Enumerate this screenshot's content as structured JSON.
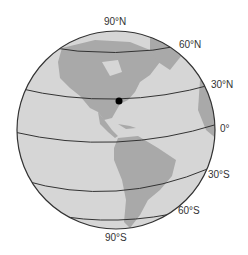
{
  "diagram": {
    "type": "globe-latitude-lines",
    "colors": {
      "ocean": "#d4d4d4",
      "land": "#a8a8a8",
      "lines": "#333333",
      "marker": "#000000"
    },
    "labels": {
      "n90": "90°N",
      "n60": "60°N",
      "n30": "30°N",
      "eq": "0°",
      "s30": "30°S",
      "s60": "60°S",
      "s90": "90°S"
    },
    "marker": {
      "description": "point on 30°N line in eastern North America"
    }
  }
}
